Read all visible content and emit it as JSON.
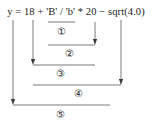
{
  "diagram": {
    "type": "expression-evaluation-order",
    "expression": "y = 18 + 'B' / 'b' * 20 − sqrt(4.0)",
    "expression_parts": {
      "lhs": "y",
      "assign": "=",
      "operand_1": "18",
      "operator_1": "+",
      "operand_2": "'B'",
      "operator_2": "/",
      "operand_3": "'b'",
      "operator_3": "*",
      "operand_4": "20",
      "operator_4": "−",
      "operand_5": "sqrt(4.0)"
    },
    "line_color": "#7b7b7b",
    "text_color": "#1a1a1a",
    "background_color": "#ffffff",
    "steps": [
      {
        "id": "step-1",
        "label": "①",
        "order": 1,
        "operation": "'B' / 'b'",
        "bracket": {
          "x1": 48,
          "x2": 75,
          "y": 22
        },
        "label_pos": {
          "x": 61,
          "y": 27
        },
        "arrow": null
      },
      {
        "id": "step-2",
        "label": "②",
        "order": 2,
        "operation": "result * 20",
        "bracket": {
          "x1": 48,
          "x2": 95,
          "y": 45
        },
        "label_pos": {
          "x": 69,
          "y": 49
        },
        "arrow": {
          "x": 95,
          "y1": 22,
          "y2": 45,
          "direction": "down"
        }
      },
      {
        "id": "step-3",
        "label": "③",
        "order": 3,
        "operation": "18 + result",
        "bracket": {
          "x1": 33,
          "x2": 95,
          "y": 65
        },
        "label_pos": {
          "x": 60,
          "y": 69
        },
        "arrow": {
          "x": 33,
          "y1": 20,
          "y2": 65,
          "direction": "down"
        }
      },
      {
        "id": "step-4",
        "label": "④",
        "order": 4,
        "operation": "result − sqrt(4.0)",
        "bracket": {
          "x1": 33,
          "x2": 121,
          "y": 85
        },
        "label_pos": {
          "x": 78,
          "y": 89
        },
        "arrow": {
          "x": 121,
          "y1": 20,
          "y2": 85,
          "direction": "down"
        }
      },
      {
        "id": "step-5",
        "label": "⑤",
        "order": 5,
        "operation": "y = result",
        "bracket": {
          "x1": 13,
          "x2": 110,
          "y": 105
        },
        "label_pos": {
          "x": 60,
          "y": 110
        },
        "arrow": {
          "x": 13,
          "y1": 20,
          "y2": 105,
          "direction": "down"
        }
      }
    ]
  }
}
